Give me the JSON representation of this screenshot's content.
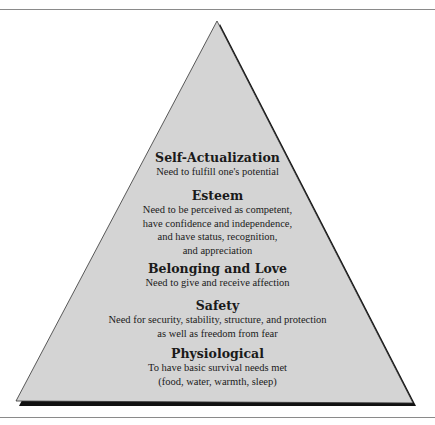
{
  "diagram": {
    "type": "pyramid",
    "fill_color": "#d4d4d4",
    "shadow_color": "#111111",
    "levels": [
      {
        "title": "Self-Actualization",
        "description": [
          "Need to fulfill one's potential"
        ]
      },
      {
        "title": "Esteem",
        "description": [
          "Need to be perceived as competent,",
          "have confidence and independence,",
          "and have status, recognition,",
          "and appreciation"
        ]
      },
      {
        "title": "Belonging and Love",
        "description": [
          "Need to give and receive affection"
        ]
      },
      {
        "title": "Safety",
        "description": [
          "Need for security, stability, structure, and protection",
          "as well as freedom from fear"
        ]
      },
      {
        "title": "Physiological",
        "description": [
          "To have basic survival needs met",
          "(food, water, warmth, sleep)"
        ]
      }
    ]
  }
}
